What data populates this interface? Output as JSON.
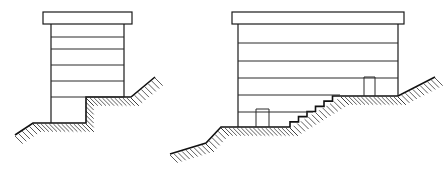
{
  "figure": {
    "colors": {
      "line": "#1a1a1a",
      "background": "#ffffff",
      "hatch": "#333333"
    },
    "left_building": {
      "roof": {
        "x": 43,
        "y": 12,
        "w": 89,
        "h": 12
      },
      "walls": {
        "left_x": 51,
        "right_x": 124,
        "top_y": 24,
        "bottom_left_y": 123,
        "bottom_right_y": 97
      },
      "floor_lines_y": [
        37,
        49,
        65,
        81,
        97
      ],
      "basement_step_x": 86,
      "ground_profile": [
        [
          15,
          135
        ],
        [
          33,
          123
        ],
        [
          86,
          123
        ],
        [
          86,
          97
        ],
        [
          131,
          97
        ],
        [
          155,
          77
        ]
      ]
    },
    "right_building": {
      "roof": {
        "x": 232,
        "y": 12,
        "w": 172,
        "h": 12
      },
      "walls": {
        "left_x": 238,
        "right_x": 398,
        "top_y": 24,
        "bottom_left_y": 127,
        "bottom_right_y": 96
      },
      "floor_lines": [
        {
          "y": 43,
          "x2": 398
        },
        {
          "y": 61,
          "x2": 398
        },
        {
          "y": 78,
          "x2": 398
        },
        {
          "y": 95,
          "x2": 340
        },
        {
          "y": 112,
          "x2": 313
        }
      ],
      "lower_door": {
        "x": 256,
        "y": 109,
        "w": 13,
        "h": 18
      },
      "upper_door": {
        "x": 364,
        "y": 77,
        "w": 11,
        "h": 19
      },
      "stairs": {
        "start": [
          290,
          127
        ],
        "end": [
          341,
          96
        ],
        "steps": 6
      },
      "ground_profile": [
        [
          170,
          154
        ],
        [
          206,
          143
        ],
        [
          221,
          127
        ],
        [
          290,
          127
        ]
      ],
      "ground_profile_upper": [
        [
          341,
          96
        ],
        [
          398,
          96
        ],
        [
          435,
          77
        ]
      ]
    }
  }
}
